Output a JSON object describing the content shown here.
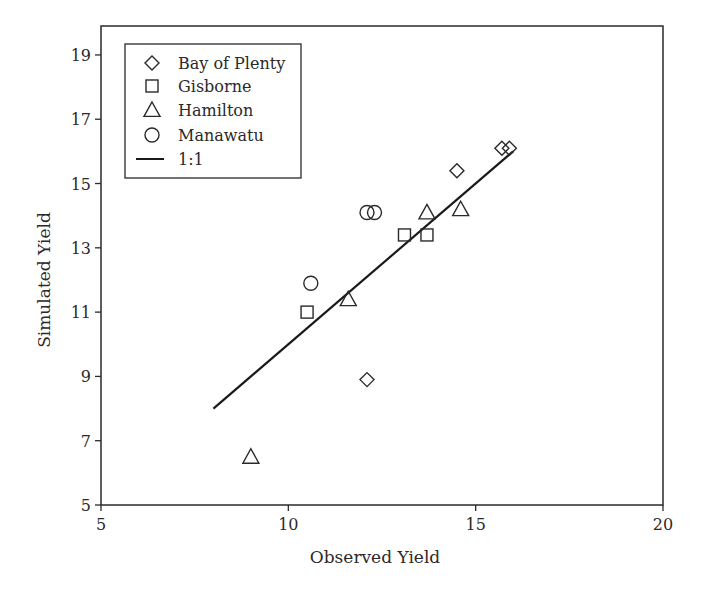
{
  "chart_data": {
    "type": "scatter",
    "title": "",
    "xlabel": "Observed Yield",
    "ylabel": "Simulated Yield",
    "xlim": [
      5,
      20
    ],
    "ylim": [
      5,
      19.9
    ],
    "xticks": [
      5,
      10,
      15,
      20
    ],
    "yticks": [
      5,
      7,
      9,
      11,
      13,
      15,
      17,
      19
    ],
    "grid": false,
    "legend_position": "upper left",
    "series": [
      {
        "name": "Bay of Plenty",
        "marker": "diamond",
        "points": [
          [
            15.7,
            16.1
          ],
          [
            15.9,
            16.1
          ],
          [
            14.5,
            15.4
          ],
          [
            12.1,
            8.9
          ]
        ]
      },
      {
        "name": "Gisborne",
        "marker": "square",
        "points": [
          [
            10.5,
            11.0
          ],
          [
            13.1,
            13.4
          ],
          [
            13.7,
            13.4
          ]
        ]
      },
      {
        "name": "Hamilton",
        "marker": "triangle",
        "points": [
          [
            9.0,
            6.5
          ],
          [
            11.6,
            11.4
          ],
          [
            13.7,
            14.1
          ],
          [
            14.6,
            14.2
          ]
        ]
      },
      {
        "name": "Manawatu",
        "marker": "circle",
        "points": [
          [
            10.6,
            11.9
          ],
          [
            12.1,
            14.1
          ],
          [
            12.3,
            14.1
          ]
        ]
      }
    ],
    "reference_line": {
      "name": "1:1",
      "from": [
        8,
        8
      ],
      "to": [
        16,
        16
      ]
    }
  },
  "legend": {
    "items": [
      {
        "label": "Bay of Plenty",
        "marker": "diamond"
      },
      {
        "label": "Gisborne",
        "marker": "square"
      },
      {
        "label": "Hamilton",
        "marker": "triangle"
      },
      {
        "label": "Manawatu",
        "marker": "circle"
      },
      {
        "label": "1:1",
        "marker": "line"
      }
    ]
  },
  "colors": {
    "ink": "#2a2a2a",
    "background": "#ffffff"
  }
}
